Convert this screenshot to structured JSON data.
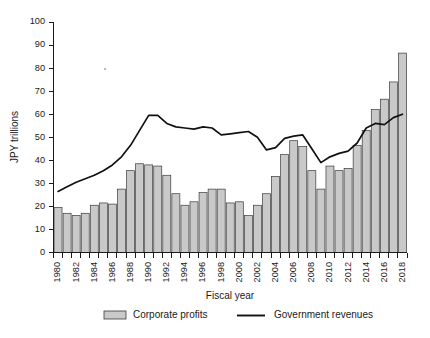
{
  "chart_data": {
    "type": "bar",
    "title": "",
    "xlabel": "Fiscal year",
    "ylabel": "JPY trillions",
    "ylim": [
      0,
      100
    ],
    "yticks": [
      0,
      10,
      20,
      30,
      40,
      50,
      60,
      70,
      80,
      90,
      100
    ],
    "grid": false,
    "legend_position": "bottom",
    "categories": [
      "1980",
      "1981",
      "1982",
      "1983",
      "1984",
      "1985",
      "1986",
      "1987",
      "1988",
      "1989",
      "1990",
      "1991",
      "1992",
      "1993",
      "1994",
      "1995",
      "1996",
      "1997",
      "1998",
      "1999",
      "2000",
      "2001",
      "2002",
      "2003",
      "2004",
      "2005",
      "2006",
      "2007",
      "2008",
      "2009",
      "2010",
      "2011",
      "2012",
      "2013",
      "2014",
      "2015",
      "2016",
      "2017",
      "2018"
    ],
    "xtick_labels": [
      "1980",
      "1982",
      "1984",
      "1986",
      "1988",
      "1990",
      "1992",
      "1994",
      "1996",
      "1998",
      "2000",
      "2002",
      "2004",
      "2006",
      "2008",
      "2010",
      "2012",
      "2014",
      "2016",
      "2018"
    ],
    "series": [
      {
        "name": "Corporate profits",
        "type": "bar",
        "color": "#c9c9c9",
        "edge_color": "#3a3a3a",
        "values": [
          19.5,
          17.0,
          16.0,
          17.0,
          20.5,
          21.5,
          21.0,
          27.5,
          35.5,
          38.5,
          38.0,
          37.5,
          33.5,
          25.5,
          20.5,
          22.0,
          26.0,
          27.5,
          27.5,
          21.5,
          22.0,
          16.0,
          20.5,
          25.5,
          33.0,
          42.5,
          48.5,
          46.0,
          35.5,
          27.5,
          37.5,
          35.5,
          36.5,
          46.5,
          53.0,
          62.0,
          66.5,
          74.0,
          86.5
        ]
      },
      {
        "name": "Government revenues",
        "type": "line",
        "color": "#111111",
        "values": [
          26.5,
          28.5,
          30.5,
          32.0,
          33.5,
          35.5,
          38.0,
          41.5,
          46.5,
          53.0,
          59.5,
          59.5,
          56.0,
          54.5,
          54.0,
          53.5,
          54.5,
          54.0,
          51.0,
          51.5,
          52.0,
          52.5,
          50.0,
          44.5,
          45.5,
          49.5,
          50.5,
          51.0,
          45.0,
          39.0,
          41.5,
          43.0,
          44.0,
          47.5,
          54.0,
          56.0,
          55.5,
          58.5,
          60.0
        ]
      }
    ],
    "legend": [
      {
        "label": "Corporate profits",
        "marker": "bar-swatch"
      },
      {
        "label": "Government revenues",
        "marker": "line-swatch"
      }
    ]
  }
}
